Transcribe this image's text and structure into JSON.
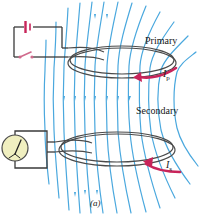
{
  "figure": {
    "caption": "(a)",
    "labels": {
      "primary": "Primary",
      "secondary": "Secondary",
      "current_primary_symbol": "I",
      "current_primary_sub": "p",
      "current_secondary_symbol": "I",
      "current_secondary_sub": "s"
    },
    "colors": {
      "field_line": "#4aa8de",
      "current_arrow": "#c8245a",
      "battery": "#c8245a",
      "switch": "#d06a8c",
      "wire": "#3a3a3a",
      "coil": "#4a4a4a",
      "meter_face": "#f0efc0",
      "background": "#ffffff"
    },
    "components": {
      "battery": "battery-cell",
      "switch": "open-switch",
      "meter": "galvanometer",
      "primary_coil": "loop-coil",
      "secondary_coil": "loop-coil"
    },
    "field": {
      "line_count": 13,
      "arrow_direction": "down"
    }
  }
}
